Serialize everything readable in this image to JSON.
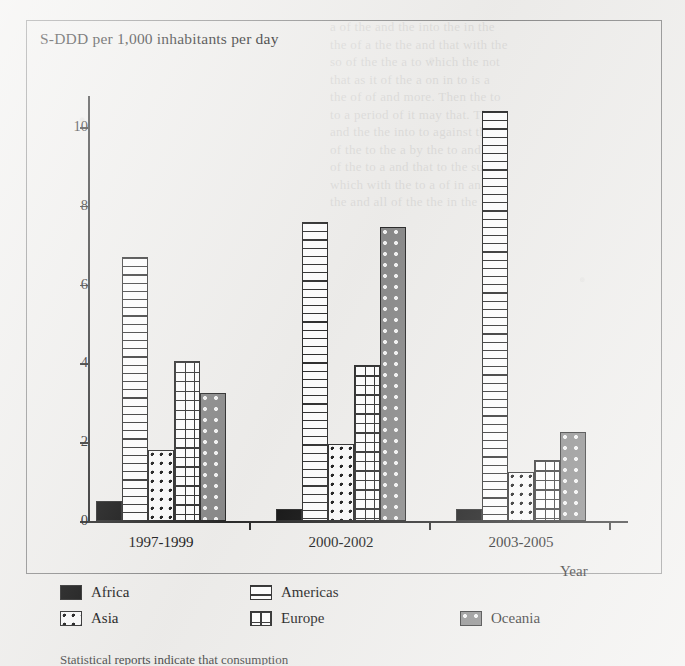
{
  "chart_data": {
    "type": "bar",
    "title": "S-DDD per 1,000 inhabitants per day",
    "xlabel": "Year",
    "ylabel": "",
    "categories": [
      "1997-1999",
      "2000-2002",
      "2003-2005"
    ],
    "series": [
      {
        "name": "Africa",
        "values": [
          0.5,
          0.3,
          0.3
        ],
        "pattern": "solid-black",
        "color": "#121212"
      },
      {
        "name": "Americas",
        "values": [
          6.7,
          7.6,
          10.4
        ],
        "pattern": "horizontal-lines",
        "color": "#ffffff"
      },
      {
        "name": "Asia",
        "values": [
          1.8,
          1.95,
          1.25
        ],
        "pattern": "dots-light",
        "color": "#fbfbfb"
      },
      {
        "name": "Europe",
        "values": [
          4.05,
          3.95,
          1.55
        ],
        "pattern": "grid",
        "color": "#ffffff"
      },
      {
        "name": "Oceania",
        "values": [
          3.25,
          7.45,
          2.25
        ],
        "pattern": "dots-on-gray",
        "color": "#8a8a8a"
      }
    ],
    "ylim": [
      0,
      11
    ],
    "yticks": [
      0,
      2,
      4,
      6,
      8,
      10
    ],
    "ytick_labels": [
      "0",
      "2",
      "4",
      "6",
      "8",
      "10"
    ],
    "grid": false,
    "legend_position": "below-plot"
  },
  "legend": {
    "entries": [
      {
        "label": "Africa",
        "pattern": "solid-black"
      },
      {
        "label": "Americas",
        "pattern": "horizontal-lines"
      },
      {
        "label": "Asia",
        "pattern": "dots-light"
      },
      {
        "label": "Europe",
        "pattern": "grid"
      },
      {
        "label": "Oceania",
        "pattern": "dots-on-gray"
      }
    ]
  },
  "bleed_through_text": "a of the and the into the in the\nthe of a the the and that with the\nso of the the a to which the not\nthat as it of the a on in to is a\nthe of of and more. Then the to\nto a period of it may that. The\nand the the into to against the\nof the to the a by the to and the\nof the to a and that to the such\nwhich with the to a of in and\nthe and all of the the in the a",
  "caption_fragment": "Statistical reports indicate that consumption"
}
